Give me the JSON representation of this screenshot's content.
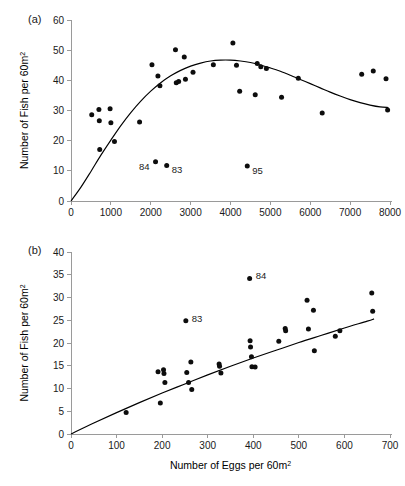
{
  "figure": {
    "panel_a_tag": "(a)",
    "panel_b_tag": "(b)"
  },
  "chart_data": [
    {
      "type": "scatter",
      "panel": "(a)",
      "title": "",
      "xlabel": "",
      "ylabel": "Number of Fish per 60m2",
      "ylabel_text": "Number of Fish per 60m",
      "ylabel_sup": "2",
      "xlim": [
        0,
        8000
      ],
      "ylim": [
        0,
        60
      ],
      "xticks": [
        0,
        1000,
        2000,
        3000,
        4000,
        5000,
        6000,
        7000,
        8000
      ],
      "xtick_labels": [
        "0",
        "1000",
        "2000",
        "3000",
        "4000",
        "5000",
        "6000",
        "7000",
        "8000"
      ],
      "yticks": [
        0,
        10,
        20,
        30,
        40,
        50,
        60
      ],
      "ytick_labels": [
        "0",
        "10",
        "20",
        "30",
        "40",
        "50",
        "60"
      ],
      "grid": false,
      "legend": "none",
      "points": [
        [
          520,
          28.6
        ],
        [
          700,
          30.3
        ],
        [
          710,
          26.6
        ],
        [
          720,
          17.1
        ],
        [
          980,
          30.6
        ],
        [
          1000,
          25.9
        ],
        [
          1090,
          19.7
        ],
        [
          1720,
          26.2
        ],
        [
          2030,
          45.2
        ],
        [
          2120,
          13.0
        ],
        [
          2180,
          41.4
        ],
        [
          2230,
          38.2
        ],
        [
          2400,
          11.8
        ],
        [
          2620,
          50.1
        ],
        [
          2640,
          39.2
        ],
        [
          2700,
          39.6
        ],
        [
          2840,
          47.7
        ],
        [
          2870,
          40.4
        ],
        [
          3060,
          42.7
        ],
        [
          3570,
          45.2
        ],
        [
          4060,
          52.4
        ],
        [
          4150,
          45.0
        ],
        [
          4230,
          36.4
        ],
        [
          4420,
          11.6
        ],
        [
          4620,
          35.2
        ],
        [
          4670,
          45.6
        ],
        [
          4760,
          44.5
        ],
        [
          4900,
          43.9
        ],
        [
          5280,
          34.4
        ],
        [
          5700,
          40.7
        ],
        [
          6300,
          29.2
        ],
        [
          7290,
          42.0
        ],
        [
          7580,
          43.1
        ],
        [
          7900,
          40.5
        ],
        [
          7940,
          30.2
        ]
      ],
      "annotations": [
        {
          "label": "84",
          "x": 2120,
          "y": 13.0
        },
        {
          "label": "83",
          "x": 2400,
          "y": 11.8
        },
        {
          "label": "95",
          "x": 4420,
          "y": 11.6
        }
      ],
      "fit_curve": {
        "description": "dome-shaped fitted curve",
        "points": [
          [
            0,
            0
          ],
          [
            250,
            4.6
          ],
          [
            500,
            9.8
          ],
          [
            750,
            15.2
          ],
          [
            1000,
            20.2
          ],
          [
            1250,
            25.0
          ],
          [
            1500,
            29.3
          ],
          [
            1750,
            33.1
          ],
          [
            2000,
            36.4
          ],
          [
            2250,
            39.2
          ],
          [
            2500,
            41.5
          ],
          [
            2750,
            43.3
          ],
          [
            3000,
            44.7
          ],
          [
            3250,
            45.7
          ],
          [
            3500,
            46.4
          ],
          [
            3750,
            46.7
          ],
          [
            4000,
            46.7
          ],
          [
            4250,
            46.4
          ],
          [
            4500,
            45.9
          ],
          [
            4750,
            45.1
          ],
          [
            5000,
            44.1
          ],
          [
            5250,
            43.0
          ],
          [
            5500,
            41.7
          ],
          [
            5750,
            40.3
          ],
          [
            6000,
            38.9
          ],
          [
            6250,
            37.5
          ],
          [
            6500,
            36.1
          ],
          [
            6750,
            34.8
          ],
          [
            7000,
            33.6
          ],
          [
            7250,
            32.6
          ],
          [
            7500,
            31.8
          ],
          [
            7750,
            31.2
          ],
          [
            7960,
            31.0
          ]
        ]
      }
    },
    {
      "type": "scatter",
      "panel": "(b)",
      "title": "",
      "xlabel": "Number of Eggs per 60m2",
      "xlabel_text": "Number of Eggs per 60m",
      "xlabel_sup": "2",
      "ylabel": "Number of Fish per 60m2",
      "ylabel_text": "Number of Fish per 60m",
      "ylabel_sup": "2",
      "xlim": [
        0,
        700
      ],
      "ylim": [
        0,
        40
      ],
      "xticks": [
        0,
        100,
        200,
        300,
        400,
        500,
        600,
        700
      ],
      "xtick_labels": [
        "0",
        "100",
        "200",
        "300",
        "400",
        "500",
        "600",
        "700"
      ],
      "yticks": [
        0,
        5,
        10,
        15,
        20,
        25,
        30,
        35,
        40
      ],
      "ytick_labels": [
        "0",
        "5",
        "10",
        "15",
        "20",
        "25",
        "30",
        "35",
        "40"
      ],
      "grid": false,
      "legend": "none",
      "points": [
        [
          121,
          4.7
        ],
        [
          191,
          13.7
        ],
        [
          196,
          6.8
        ],
        [
          203,
          14.1
        ],
        [
          204,
          13.3
        ],
        [
          206,
          11.3
        ],
        [
          252,
          24.9
        ],
        [
          254,
          13.5
        ],
        [
          258,
          11.3
        ],
        [
          263,
          15.8
        ],
        [
          265,
          9.8
        ],
        [
          325,
          15.4
        ],
        [
          326,
          14.9
        ],
        [
          329,
          13.4
        ],
        [
          392,
          34.2
        ],
        [
          393,
          20.5
        ],
        [
          394,
          19.1
        ],
        [
          396,
          17.0
        ],
        [
          397,
          14.8
        ],
        [
          404,
          14.7
        ],
        [
          456,
          20.4
        ],
        [
          470,
          23.2
        ],
        [
          471,
          22.7
        ],
        [
          518,
          29.4
        ],
        [
          521,
          23.1
        ],
        [
          532,
          27.2
        ],
        [
          534,
          18.3
        ],
        [
          580,
          21.5
        ],
        [
          590,
          22.7
        ],
        [
          660,
          31.0
        ],
        [
          662,
          27.0
        ]
      ],
      "annotations": [
        {
          "label": "83",
          "x": 252,
          "y": 24.9
        },
        {
          "label": "84",
          "x": 392,
          "y": 34.2
        }
      ],
      "fit_curve": {
        "description": "concave increasing fitted curve",
        "points": [
          [
            0,
            0
          ],
          [
            50,
            2.4
          ],
          [
            100,
            4.7
          ],
          [
            150,
            6.9
          ],
          [
            200,
            9.0
          ],
          [
            250,
            11.0
          ],
          [
            300,
            13.0
          ],
          [
            350,
            14.9
          ],
          [
            400,
            16.7
          ],
          [
            450,
            18.4
          ],
          [
            500,
            20.1
          ],
          [
            550,
            21.7
          ],
          [
            600,
            23.3
          ],
          [
            650,
            24.8
          ],
          [
            665,
            25.3
          ]
        ]
      }
    }
  ]
}
